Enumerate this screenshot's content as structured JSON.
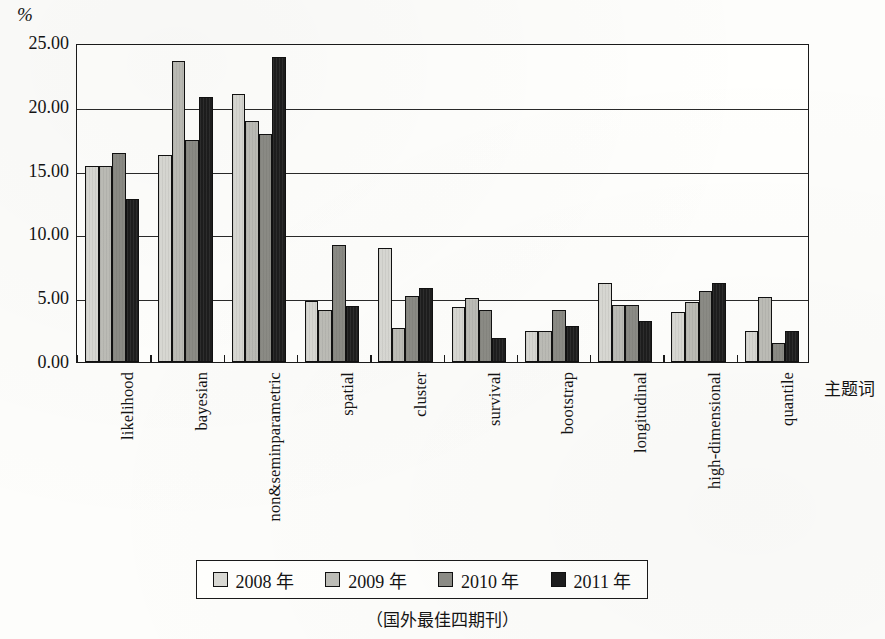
{
  "y_axis_unit": "%",
  "x_axis_title": "主题词",
  "caption": "（国外最佳四期刊）",
  "legend": {
    "items": [
      {
        "label": "2008 年",
        "color": "#d9d9d4",
        "swatch_name": "legend-swatch-2008"
      },
      {
        "label": "2009 年",
        "color": "#bdbdb7",
        "swatch_name": "legend-swatch-2009"
      },
      {
        "label": "2010 年",
        "color": "#8c8c86",
        "swatch_name": "legend-swatch-2010"
      },
      {
        "label": "2011 年",
        "color": "#1d1d1d",
        "swatch_name": "legend-swatch-2011"
      }
    ]
  },
  "chart_data": {
    "type": "bar",
    "title": "",
    "subtitle": "",
    "xlabel": "主题词",
    "ylabel": "%",
    "ylim": [
      0,
      25
    ],
    "ytick_labels": [
      "0.00",
      "5.00",
      "10.00",
      "15.00",
      "20.00",
      "25.00"
    ],
    "ytick_values": [
      0,
      5,
      10,
      15,
      20,
      25
    ],
    "grid": true,
    "grid_axis": "y",
    "legend_position": "bottom",
    "categories": [
      "likelihood",
      "bayesian",
      "non&seminparametric",
      "spatial",
      "cluster",
      "survival",
      "bootstrap",
      "longitudinal",
      "high-dimensional",
      "quantile"
    ],
    "series": [
      {
        "name": "2008 年",
        "color": "#d9d9d4",
        "values": [
          15.4,
          16.2,
          21.0,
          4.8,
          8.9,
          4.3,
          2.4,
          6.2,
          3.9,
          2.4
        ]
      },
      {
        "name": "2009 年",
        "color": "#bdbdb7",
        "values": [
          15.4,
          23.6,
          18.9,
          4.1,
          2.7,
          5.0,
          2.4,
          4.5,
          4.7,
          5.1
        ]
      },
      {
        "name": "2010 年",
        "color": "#8c8c86",
        "values": [
          16.4,
          17.4,
          17.9,
          9.2,
          5.2,
          4.1,
          4.1,
          4.5,
          5.6,
          1.5
        ]
      },
      {
        "name": "2011 年",
        "color": "#1d1d1d",
        "values": [
          12.8,
          20.8,
          23.9,
          4.4,
          5.8,
          1.9,
          2.8,
          3.2,
          6.2,
          2.4
        ]
      }
    ]
  }
}
